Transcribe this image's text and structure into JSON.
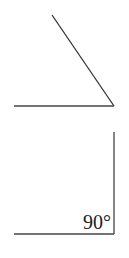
{
  "diagram": {
    "title": "",
    "figures": [
      {
        "id": "acute-angle",
        "description": "angle formed by a slanted ray and a horizontal ray meeting at a vertex on the right",
        "label": "",
        "vertex": [
          114,
          106
        ],
        "rays": [
          [
            52,
            15
          ],
          [
            14,
            106
          ]
        ]
      },
      {
        "id": "right-angle",
        "description": "right angle formed by a vertical ray and a horizontal ray meeting at a vertex on the lower right",
        "label": "90°",
        "vertex": [
          114,
          234
        ],
        "rays": [
          [
            114,
            132
          ],
          [
            14,
            234
          ]
        ]
      }
    ],
    "colors": {
      "line": "#333333",
      "text": "#222222",
      "background": "#ffffff"
    }
  }
}
